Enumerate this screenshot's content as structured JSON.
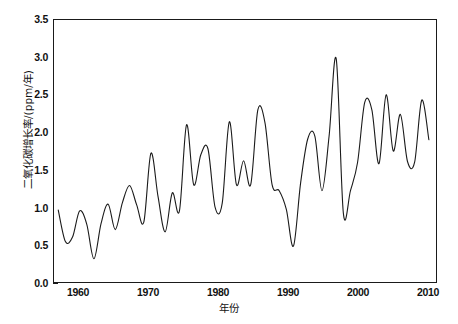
{
  "chart_data": {
    "type": "line",
    "title": "",
    "xlabel": "年份",
    "ylabel": "二氧化碳增长率/(ppm/年)",
    "xlim": [
      1958.4,
      1911.0
    ],
    "x_range": [
      1958.4,
      2012.0
    ],
    "ylim": [
      0.0,
      3.5
    ],
    "grid": false,
    "legend": null,
    "line_color": "#1a1a1a",
    "line_width": 1.1,
    "x_ticks": [
      1960,
      1970,
      1980,
      1990,
      2000,
      2010
    ],
    "x_tick_labels": [
      "1960",
      "1970",
      "1980",
      "1990",
      "2000",
      "2010"
    ],
    "y_ticks": [
      0.0,
      0.5,
      1.0,
      1.5,
      2.0,
      2.5,
      3.0,
      3.5
    ],
    "y_tick_labels": [
      "0.0",
      "0.5",
      "1.0",
      "1.5",
      "2.0",
      "2.5",
      "3.0",
      "3.5"
    ],
    "series": [
      {
        "name": "二氧化碳增长率",
        "x": [
          1959,
          1960,
          1961,
          1962,
          1963,
          1964,
          1965,
          1966,
          1967,
          1968,
          1969,
          1970,
          1971,
          1972,
          1973,
          1974,
          1975,
          1976,
          1977,
          1978,
          1979,
          1980,
          1981,
          1982,
          1983,
          1984,
          1985,
          1986,
          1987,
          1988,
          1989,
          1990,
          1991,
          1992,
          1993,
          1994,
          1995,
          1996,
          1997,
          1998,
          1999,
          2000,
          2001,
          2002,
          2003,
          2004,
          2005,
          2006,
          2007,
          2008,
          2009,
          2010,
          2011
        ],
        "values": [
          0.96,
          0.54,
          0.6,
          0.95,
          0.77,
          0.31,
          0.78,
          1.04,
          0.7,
          1.06,
          1.29,
          1.03,
          0.8,
          1.72,
          1.14,
          0.67,
          1.19,
          0.95,
          2.1,
          1.3,
          1.7,
          1.78,
          1.0,
          1.05,
          2.14,
          1.3,
          1.62,
          1.3,
          2.3,
          2.13,
          1.3,
          1.22,
          0.97,
          0.48,
          1.32,
          1.91,
          1.95,
          1.22,
          1.95,
          2.98,
          0.92,
          1.22,
          1.6,
          2.4,
          2.3,
          1.58,
          2.5,
          1.75,
          2.24,
          1.61,
          1.6,
          2.43,
          1.9
        ]
      }
    ]
  },
  "axis": {
    "x_title": "年份",
    "y_title": "二氧化碳增长率/(ppm/年)"
  }
}
